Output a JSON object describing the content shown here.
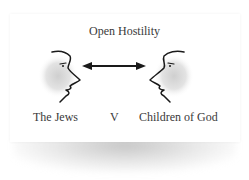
{
  "diagram": {
    "title": "Open Hostility",
    "left_label": "The Jews",
    "versus_label": "V",
    "right_label": "Children of God",
    "relation": "double-headed arrow between two facing profiles",
    "colors": {
      "ink": "#1a1a1a",
      "text": "#3a3a3a",
      "face_shade": "#d9d9d9",
      "background": "#ffffff"
    },
    "icons": [
      "face-profile-right-icon",
      "double-arrow-icon",
      "face-profile-left-icon"
    ]
  }
}
